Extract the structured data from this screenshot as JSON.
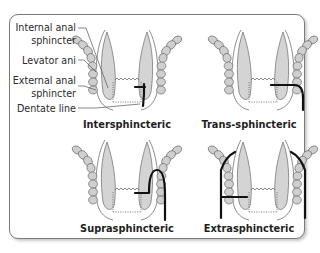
{
  "labels": {
    "internal_anal_sphincter_line1": "Internal anal",
    "internal_anal_sphincter_line2": "sphincter",
    "levator_ani": "Levator ani",
    "external_anal_sphincter_line1": "External anal",
    "external_anal_sphincter_line2": "sphincter",
    "dentate_line": "Dentate line"
  },
  "panels": [
    {
      "id": "intersphincteric",
      "caption": "Intersphincteric"
    },
    {
      "id": "trans-sphincteric",
      "caption": "Trans-sphincteric"
    },
    {
      "id": "suprasphincteric",
      "caption": "Suprasphincteric"
    },
    {
      "id": "extrasphincteric",
      "caption": "Extrasphincteric"
    }
  ],
  "colors": {
    "muscle_fill": "#d4d4d4",
    "outline": "#707070",
    "fistula": "#111111",
    "frame_border": "#7a7a7a"
  }
}
